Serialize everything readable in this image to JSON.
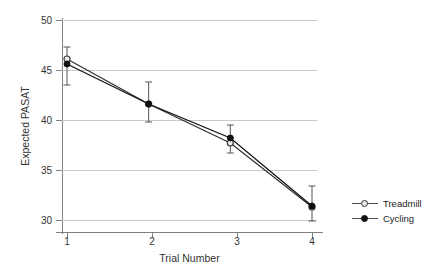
{
  "chart_data": {
    "type": "line",
    "title": "",
    "xlabel": "Trial Number",
    "ylabel": "Expected PASAT",
    "x": [
      1,
      2,
      3,
      4
    ],
    "categories": [
      "1",
      "2",
      "3",
      "4"
    ],
    "xlim": [
      0.8,
      4.2
    ],
    "ylim": [
      29,
      50.5
    ],
    "yticks": [
      30,
      35,
      40,
      45,
      50
    ],
    "ytick_labels": [
      "30",
      "35",
      "40",
      "45",
      "50"
    ],
    "xticks": [
      1,
      2,
      3,
      4
    ],
    "xtick_labels": [
      "1",
      "2",
      "3",
      "4"
    ],
    "grid": "horizontal",
    "legend_position": "right",
    "series": [
      {
        "name": "Treadmill",
        "marker": "open-circle",
        "color": "#333333",
        "values": [
          46.1,
          41.6,
          37.7,
          31.3
        ],
        "err_low": [
          43.5,
          39.8,
          36.7,
          29.9
        ],
        "err_high": [
          47.3,
          43.8,
          39.5,
          33.4
        ]
      },
      {
        "name": "Cycling",
        "marker": "filled-circle",
        "color": "#111111",
        "values": [
          45.6,
          41.6,
          38.2,
          31.4
        ],
        "err_low": [
          43.5,
          39.8,
          36.7,
          29.9
        ],
        "err_high": [
          47.3,
          43.8,
          39.5,
          33.4
        ]
      }
    ]
  },
  "legend": {
    "items": [
      {
        "label": "Treadmill",
        "marker": "open-circle"
      },
      {
        "label": "Cycling",
        "marker": "filled-circle"
      }
    ]
  },
  "axes": {
    "y_title": "Expected PASAT",
    "x_title": "Trial Number",
    "y_labels": [
      "50",
      "45",
      "40",
      "35",
      "30"
    ],
    "x_labels": [
      "1",
      "2",
      "3",
      "4"
    ]
  },
  "colors": {
    "grid": "#c9c9c9",
    "axis": "#808080",
    "series_treadmill": "#4d4d4d",
    "series_cycling": "#111111",
    "text": "#333333"
  }
}
